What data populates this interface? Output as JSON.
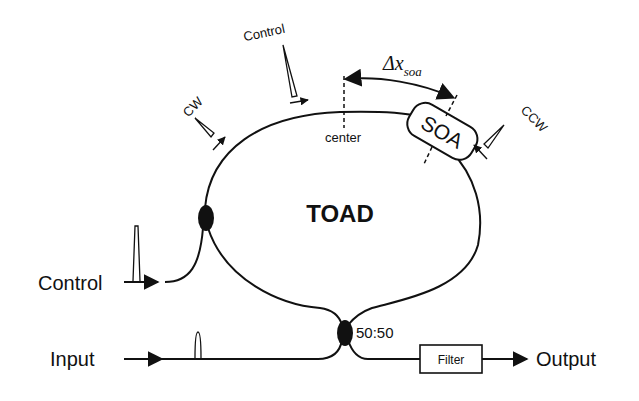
{
  "diagram": {
    "title": "TOAD",
    "labels": {
      "control_top": "Control",
      "cw": "CW",
      "ccw": "CCW",
      "center": "center",
      "soa": "SOA",
      "delta": "Δx",
      "delta_sub": "soa",
      "control_left": "Control",
      "input": "Input",
      "coupler_ratio": "50:50",
      "filter": "Filter",
      "output": "Output"
    },
    "components": [
      {
        "id": "loop",
        "type": "fiber-loop",
        "label": "TOAD"
      },
      {
        "id": "soa",
        "type": "semiconductor-optical-amplifier",
        "label": "SOA"
      },
      {
        "id": "control-coupler",
        "type": "coupler"
      },
      {
        "id": "main-coupler",
        "type": "coupler",
        "label": "50:50"
      },
      {
        "id": "filter",
        "type": "filter",
        "label": "Filter"
      }
    ],
    "edges": [
      {
        "from": "Control",
        "to": "control-coupler"
      },
      {
        "from": "Input",
        "to": "main-coupler"
      },
      {
        "from": "main-coupler",
        "to": "filter"
      },
      {
        "from": "filter",
        "to": "Output"
      }
    ]
  }
}
